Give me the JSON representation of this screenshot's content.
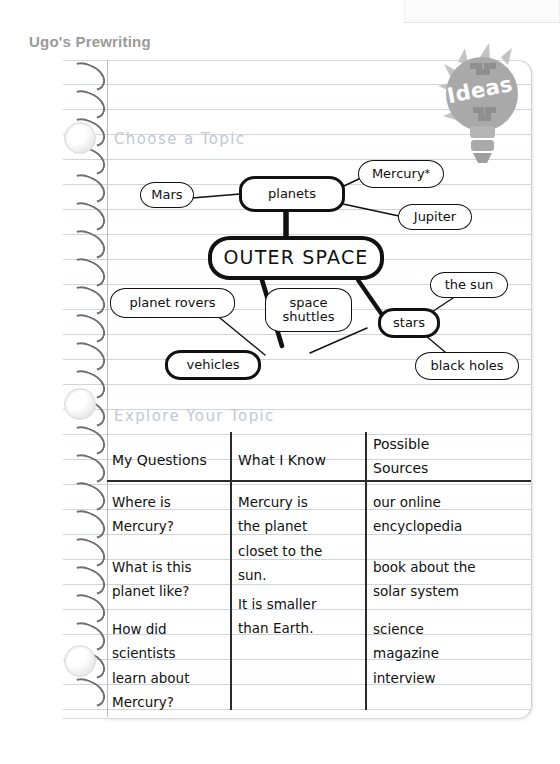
{
  "page": {
    "title": "Ugo's Prewriting",
    "badge_label": "Ideas",
    "section_one_heading": "Choose a Topic",
    "section_two_heading": "Explore Your Topic"
  },
  "concept_map": {
    "center_node": "OUTER SPACE",
    "nodes": [
      {
        "label": "Mars",
        "emphasis": "light"
      },
      {
        "label": "planets",
        "emphasis": "bold"
      },
      {
        "label": "Mercury",
        "emphasis": "light",
        "superscript": "*"
      },
      {
        "label": "Jupiter",
        "emphasis": "light"
      },
      {
        "label": "OUTER SPACE",
        "emphasis": "center"
      },
      {
        "label": "planet rovers",
        "emphasis": "light"
      },
      {
        "label": "space shuttles",
        "emphasis": "light"
      },
      {
        "label": "the sun",
        "emphasis": "light"
      },
      {
        "label": "stars",
        "emphasis": "bold"
      },
      {
        "label": "vehicles",
        "emphasis": "bold"
      },
      {
        "label": "black holes",
        "emphasis": "light"
      }
    ],
    "connections": [
      {
        "from": "Mars",
        "to": "planets",
        "weight": "thin"
      },
      {
        "from": "planets",
        "to": "Mercury",
        "weight": "thin"
      },
      {
        "from": "planets",
        "to": "Jupiter",
        "weight": "thin"
      },
      {
        "from": "planets",
        "to": "OUTER SPACE",
        "weight": "thick"
      },
      {
        "from": "OUTER SPACE",
        "to": "vehicles",
        "weight": "thick"
      },
      {
        "from": "OUTER SPACE",
        "to": "stars",
        "weight": "thick"
      },
      {
        "from": "planet rovers",
        "to": "vehicles",
        "weight": "thin"
      },
      {
        "from": "space shuttles",
        "to": "vehicles",
        "weight": "thin"
      },
      {
        "from": "stars",
        "to": "the sun",
        "weight": "thin"
      },
      {
        "from": "stars",
        "to": "black holes",
        "weight": "thin"
      }
    ]
  },
  "explore_table": {
    "columns": [
      "My Questions",
      "What I Know",
      "Possible\nSources"
    ],
    "rows": [
      {
        "question": "Where is\nMercury?",
        "know": "Mercury is\nthe planet\ncloset to the\nsun.",
        "source": "our online\nencyclopedia"
      },
      {
        "question": "What is this\nplanet like?",
        "know": "It is smaller\nthan Earth.",
        "source": "book about the\nsolar system"
      },
      {
        "question": "How did\nscientists\nlearn about\nMercury?",
        "know": "",
        "source": "science\nmagazine"
      },
      {
        "question": "",
        "know": "",
        "source": "interview"
      }
    ]
  },
  "colors": {
    "ink": "#111111",
    "heading_gray": "#9a9a9a",
    "label_gray": "#c2c9d2",
    "rule_blue": "#cdd6e0",
    "badge_gray": "#a8a8a8",
    "spiral_gray": "#6d6d74"
  }
}
